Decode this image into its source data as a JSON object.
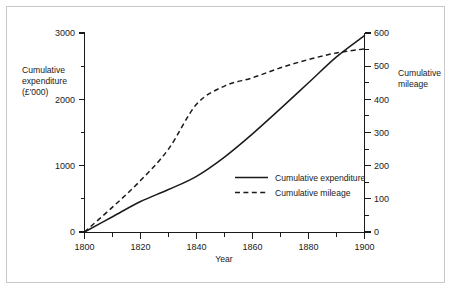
{
  "figure": {
    "background_color": "#ffffff",
    "border_color": "#c8c8c8",
    "ink_color": "#1a1a1a"
  },
  "chart_data": {
    "type": "line",
    "title": "",
    "subtitle": "",
    "xlabel": "Year",
    "ylabel": "Cumulative expenditure (£'000)",
    "y2label": "Cumulative mileage",
    "grid": false,
    "legend_position": "inside-center-right",
    "xlim": [
      1800,
      1900
    ],
    "ylim": [
      0,
      3000
    ],
    "y2lim": [
      0,
      600
    ],
    "xticks": [
      1800,
      1820,
      1840,
      1860,
      1880,
      1900
    ],
    "xtick_labels": [
      "1800",
      "1820",
      "1840",
      "1860",
      "1880",
      "1900"
    ],
    "xticks_minor": [
      1810,
      1830,
      1850,
      1870,
      1890
    ],
    "yticks": [
      0,
      1000,
      2000,
      3000
    ],
    "ytick_labels": [
      "0",
      "1000",
      "2000",
      "3000"
    ],
    "yticks_minor": [
      500,
      1500,
      2500
    ],
    "y2ticks": [
      0,
      100,
      200,
      300,
      400,
      500,
      600
    ],
    "y2tick_labels": [
      "0",
      "100",
      "200",
      "300",
      "400",
      "500",
      "600"
    ],
    "y2ticks_minor": [
      50,
      150,
      250,
      350,
      450,
      550
    ],
    "x": [
      1800,
      1810,
      1820,
      1830,
      1840,
      1850,
      1860,
      1870,
      1880,
      1890,
      1900
    ],
    "series": [
      {
        "name": "Cumulative expenditure",
        "axis": "left",
        "style": "solid",
        "units": "£'000",
        "values": [
          0,
          230,
          460,
          640,
          840,
          1130,
          1480,
          1860,
          2250,
          2640,
          2960
        ]
      },
      {
        "name": "Cumulative mileage",
        "axis": "right",
        "style": "dashed",
        "units": "miles",
        "values": [
          0,
          75,
          155,
          250,
          385,
          440,
          465,
          495,
          520,
          540,
          552
        ]
      }
    ],
    "annotations": []
  },
  "left_axis_title": {
    "line1": "Cumulative",
    "line2": "expenditure",
    "line3": "(£'000)"
  },
  "right_axis_title": {
    "line1": "Cumulative",
    "line2": "mileage"
  },
  "x_axis_title": "Year",
  "legend": {
    "entries": [
      {
        "label": "Cumulative expenditure",
        "style": "solid"
      },
      {
        "label": "Cumulative mileage",
        "style": "dashed"
      }
    ]
  }
}
